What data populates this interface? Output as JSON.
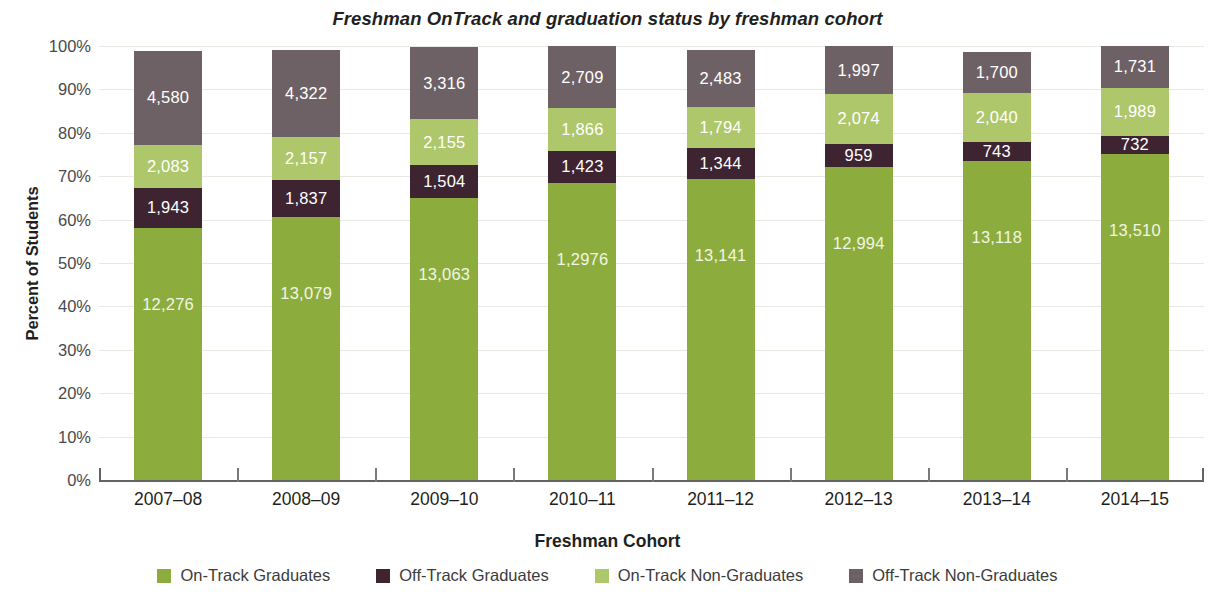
{
  "chart_data": {
    "type": "bar",
    "stacked": true,
    "stack_mode": "percent",
    "title": "Freshman OnTrack and graduation status by freshman cohort",
    "xlabel": "Freshman Cohort",
    "ylabel": "Percent of Students",
    "categories": [
      "2007–08",
      "2008–09",
      "2009–10",
      "2010–11",
      "2011–12",
      "2012–13",
      "2013–14",
      "2014–15"
    ],
    "ylim": [
      0,
      100
    ],
    "ytick_labels": [
      "0%",
      "10%",
      "20%",
      "30%",
      "40%",
      "50%",
      "60%",
      "70%",
      "80%",
      "90%",
      "100%"
    ],
    "ytick_values": [
      0,
      10,
      20,
      30,
      40,
      50,
      60,
      70,
      80,
      90,
      100
    ],
    "grid": true,
    "legend_position": "bottom",
    "series": [
      {
        "name": "On-Track Graduates",
        "color": "#8CAD3E",
        "label_color": "#F2F5E4",
        "values": [
          12276,
          13079,
          13063,
          12976,
          13141,
          12994,
          13118,
          13510
        ],
        "value_labels": [
          "12,276",
          "13,079",
          "13,063",
          "1,2976",
          "13,141",
          "12,994",
          "13,118",
          "13,510"
        ],
        "percents": [
          58.1,
          60.6,
          65.0,
          68.4,
          69.3,
          72.3,
          73.6,
          75.3
        ]
      },
      {
        "name": "Off-Track Graduates",
        "color": "#3E2431",
        "label_color": "#FFFFFF",
        "values": [
          1943,
          1837,
          1504,
          1423,
          1344,
          959,
          743,
          732
        ],
        "value_labels": [
          "1,943",
          "1,837",
          "1,504",
          "1,423",
          "1,344",
          "959",
          "743",
          "732"
        ],
        "percents": [
          9.2,
          8.5,
          7.5,
          7.5,
          7.1,
          5.3,
          4.2,
          4.1
        ]
      },
      {
        "name": "On-Track Non-Graduates",
        "color": "#ADC76A",
        "label_color": "#FFFFFF",
        "values": [
          2083,
          2157,
          2155,
          1866,
          1794,
          2074,
          2040,
          1989
        ],
        "value_labels": [
          "2,083",
          "2,157",
          "2,155",
          "1,866",
          "1,794",
          "2,074",
          "2,040",
          "1,989"
        ],
        "percents": [
          9.9,
          10.0,
          10.7,
          9.8,
          9.5,
          11.5,
          11.4,
          11.1
        ]
      },
      {
        "name": "Off-Track Non-Graduates",
        "color": "#6E6166",
        "label_color": "#FFFFFF",
        "values": [
          4580,
          4322,
          3316,
          2709,
          2483,
          1997,
          1700,
          1731
        ],
        "value_labels": [
          "4,580",
          "4,322",
          "3,316",
          "2,709",
          "2,483",
          "1,997",
          "1,700",
          "1,731"
        ],
        "percents": [
          21.7,
          20.0,
          16.5,
          14.3,
          13.1,
          11.1,
          9.5,
          9.6
        ]
      }
    ]
  },
  "legend": {
    "items": [
      {
        "label": "On-Track Graduates",
        "color": "#8CAD3E"
      },
      {
        "label": "Off-Track Graduates",
        "color": "#3E2431"
      },
      {
        "label": "On-Track Non-Graduates",
        "color": "#ADC76A"
      },
      {
        "label": "Off-Track Non-Graduates",
        "color": "#6E6166"
      }
    ]
  }
}
